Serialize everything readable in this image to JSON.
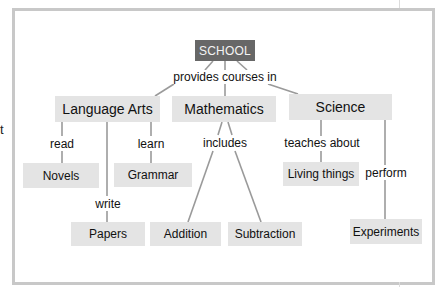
{
  "diagram": {
    "type": "concept-map",
    "edge_text": "t",
    "root": {
      "id": "school",
      "label": "SCHOOL",
      "color": "#676767"
    },
    "node_color": "#e4e4e4",
    "nodes": {
      "language_arts": "Language Arts",
      "mathematics": "Mathematics",
      "science": "Science",
      "novels": "Novels",
      "grammar": "Grammar",
      "papers": "Papers",
      "addition": "Addition",
      "subtraction": "Subtraction",
      "living_things": "Living things",
      "experiments": "Experiments"
    },
    "link_labels": {
      "provides_courses_in": "provides courses in",
      "read": "read",
      "learn": "learn",
      "write": "write",
      "includes": "includes",
      "teaches_about": "teaches about",
      "perform": "perform"
    },
    "edges": [
      {
        "from": "SCHOOL",
        "label": "provides courses in",
        "to": [
          "Language Arts",
          "Mathematics",
          "Science"
        ]
      },
      {
        "from": "Language Arts",
        "label": "read",
        "to": [
          "Novels"
        ]
      },
      {
        "from": "Language Arts",
        "label": "learn",
        "to": [
          "Grammar"
        ]
      },
      {
        "from": "Language Arts",
        "label": "write",
        "to": [
          "Papers"
        ]
      },
      {
        "from": "Mathematics",
        "label": "includes",
        "to": [
          "Addition",
          "Subtraction"
        ]
      },
      {
        "from": "Science",
        "label": "teaches about",
        "to": [
          "Living things"
        ]
      },
      {
        "from": "Science",
        "label": "perform",
        "to": [
          "Experiments"
        ]
      }
    ]
  }
}
